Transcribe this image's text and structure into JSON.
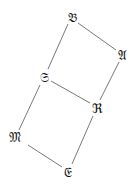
{
  "nodes": [
    {
      "id": "B",
      "label": "𝔅",
      "x": 72,
      "y": 17
    },
    {
      "id": "A",
      "label": "𝔄",
      "x": 122,
      "y": 55
    },
    {
      "id": "S",
      "label": "𝔖",
      "x": 44,
      "y": 77
    },
    {
      "id": "R",
      "label": "ℜ",
      "x": 97,
      "y": 108
    },
    {
      "id": "M",
      "label": "𝔐",
      "x": 15,
      "y": 137
    },
    {
      "id": "E",
      "label": "𝔈",
      "x": 68,
      "y": 172
    }
  ],
  "edges": [
    {
      "from": "B",
      "to": "A",
      "x1": 78,
      "y1": 23,
      "x2": 116,
      "y2": 50
    },
    {
      "from": "B",
      "to": "S",
      "x1": 68,
      "y1": 24,
      "x2": 48,
      "y2": 69
    },
    {
      "from": "S",
      "to": "R",
      "x1": 51,
      "y1": 81,
      "x2": 90,
      "y2": 103
    },
    {
      "from": "A",
      "to": "R",
      "x1": 119,
      "y1": 62,
      "x2": 100,
      "y2": 100
    },
    {
      "from": "S",
      "to": "M",
      "x1": 40,
      "y1": 85,
      "x2": 19,
      "y2": 130
    },
    {
      "from": "R",
      "to": "E",
      "x1": 93,
      "y1": 116,
      "x2": 72,
      "y2": 164
    },
    {
      "from": "M",
      "to": "E",
      "x1": 28,
      "y1": 145,
      "x2": 62,
      "y2": 167
    }
  ]
}
